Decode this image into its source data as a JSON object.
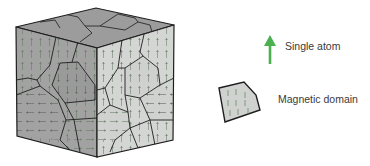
{
  "figure": {
    "cube": {
      "faces": {
        "top": {
          "fill": "#9c9c9c"
        },
        "left": {
          "fill": "#a2a2a2"
        },
        "right": {
          "fill": "#d4d6d3"
        }
      },
      "edge_color": "#1e1e1e",
      "arrow_color": "#6e8a6a"
    },
    "legend": {
      "items": [
        {
          "id": "atom",
          "icon": "green-up-arrow-icon",
          "label": "Single atom",
          "color": "#4caf50"
        },
        {
          "id": "domain",
          "icon": "domain-polygon-icon",
          "label": "Magnetic domain",
          "fill": "#cfd2cf"
        }
      ]
    }
  }
}
